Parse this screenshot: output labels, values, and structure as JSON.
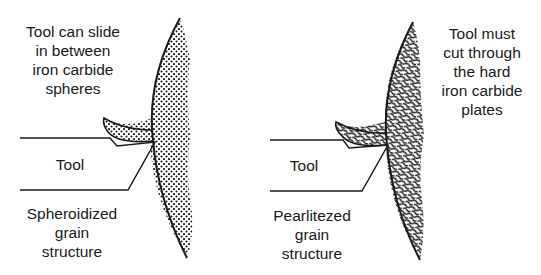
{
  "panels": [
    {
      "id": "spheroidized",
      "top_caption": [
        "Tool can slide",
        "in between",
        "iron carbide",
        "spheres"
      ],
      "tool_label": "Tool",
      "bottom_caption": [
        "Spheroidized",
        "grain",
        "structure"
      ],
      "texture": "dots"
    },
    {
      "id": "pearlitized",
      "top_caption": [
        "Tool must",
        "cut through",
        "the hard",
        "iron carbide",
        "plates"
      ],
      "tool_label": "Tool",
      "bottom_caption": [
        "Pearlitezed",
        "grain",
        "structure"
      ],
      "texture": "lamellae"
    }
  ],
  "colors": {
    "ink": "#1a1a1a",
    "background": "#ffffff"
  }
}
